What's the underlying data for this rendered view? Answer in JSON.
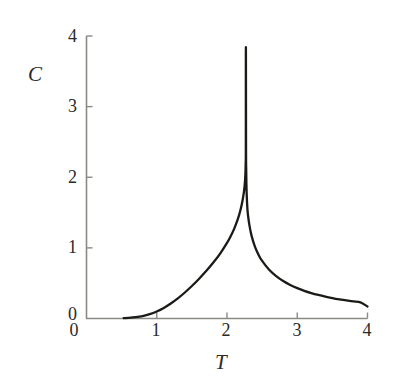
{
  "chart_data": {
    "type": "line",
    "title": "",
    "subtitle": "",
    "xlabel": "T",
    "ylabel": "C",
    "xlim": [
      0,
      4
    ],
    "ylim": [
      0,
      4
    ],
    "grid": false,
    "legend": null,
    "annotations": [],
    "xticks": [
      0,
      1,
      2,
      3,
      4
    ],
    "xtick_labels": [
      "0",
      "1",
      "2",
      "3",
      "4"
    ],
    "yticks": [
      0,
      1,
      2,
      3,
      4
    ],
    "ytick_labels": [
      "0",
      "1",
      "2",
      "3",
      "4"
    ],
    "axis_color": "#8a8a85",
    "curve_color": "#1a1a16",
    "background_color": "#ffffff",
    "series": [
      {
        "name": "heat capacity",
        "critical_point": 2.269,
        "peak_value": 3.68,
        "x": [
          0.53,
          0.6,
          0.7,
          0.8,
          0.9,
          1.0,
          1.1,
          1.2,
          1.3,
          1.4,
          1.5,
          1.6,
          1.7,
          1.8,
          1.9,
          2.0,
          2.05,
          2.1,
          2.15,
          2.19,
          2.22,
          2.24,
          2.25,
          2.258,
          2.263,
          2.266,
          2.268,
          2.2685,
          2.2695,
          2.271,
          2.273,
          2.276,
          2.28,
          2.29,
          2.3,
          2.32,
          2.35,
          2.4,
          2.45,
          2.5,
          2.6,
          2.7,
          2.8,
          2.9,
          3.0,
          3.1,
          3.2,
          3.3,
          3.4,
          3.5,
          3.6,
          3.7,
          3.8,
          3.9,
          4.0
        ],
        "y": [
          0.005,
          0.008,
          0.018,
          0.035,
          0.062,
          0.1,
          0.15,
          0.212,
          0.285,
          0.368,
          0.46,
          0.56,
          0.668,
          0.785,
          0.915,
          1.07,
          1.16,
          1.265,
          1.395,
          1.53,
          1.665,
          1.785,
          1.87,
          1.97,
          2.08,
          2.21,
          2.4,
          3.68,
          3.68,
          2.38,
          2.13,
          1.93,
          1.77,
          1.56,
          1.455,
          1.315,
          1.17,
          1.01,
          0.9,
          0.815,
          0.69,
          0.6,
          0.53,
          0.475,
          0.43,
          0.392,
          0.36,
          0.333,
          0.31,
          0.29,
          0.272,
          0.256,
          0.242,
          0.228,
          0.17
        ]
      }
    ]
  },
  "axes": {
    "y_title": "C",
    "x_title": "T"
  }
}
